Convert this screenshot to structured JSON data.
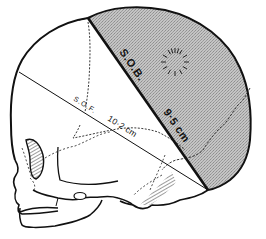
{
  "figure": {
    "shaded_region_color": "#bdbdbd",
    "line_color": "#111111",
    "diameters": [
      {
        "abbr": "S.O.B.",
        "measurement": "9.5 cm",
        "style": "bold",
        "position": "boundary of shaded vertex region"
      },
      {
        "abbr": "S.O.F.",
        "measurement": "10.2 cm",
        "style": "thin",
        "position": "line across skull from occiput to forehead"
      }
    ],
    "markings": {
      "fontanelle": "dashed radiating circle (anterior fontanelle)"
    }
  }
}
